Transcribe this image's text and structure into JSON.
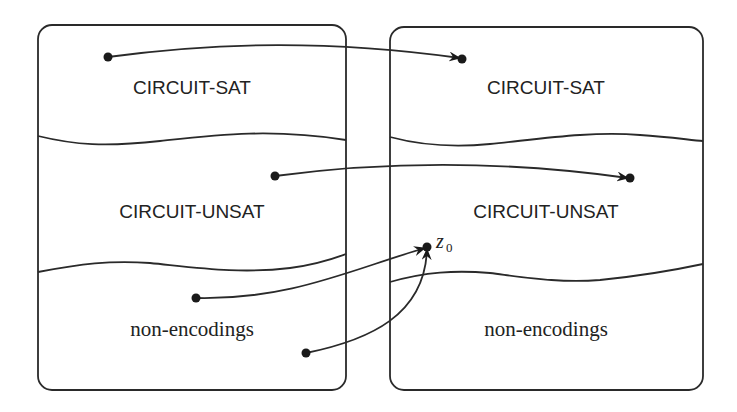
{
  "diagram": {
    "type": "reduction-mapping",
    "left_box": {
      "regions": [
        {
          "label": "CIRCUIT-SAT"
        },
        {
          "label": "CIRCUIT-UNSAT"
        },
        {
          "label": "non-encodings"
        }
      ]
    },
    "right_box": {
      "regions": [
        {
          "label": "CIRCUIT-SAT"
        },
        {
          "label": "CIRCUIT-UNSAT"
        },
        {
          "label": "non-encodings"
        }
      ]
    },
    "special_point": {
      "symbol": "z",
      "subscript": "0"
    },
    "arrows": [
      {
        "from": "left CIRCUIT-SAT",
        "to": "right CIRCUIT-SAT"
      },
      {
        "from": "left CIRCUIT-UNSAT",
        "to": "right CIRCUIT-UNSAT"
      },
      {
        "from": "left non-encodings (point 1)",
        "to": "z0"
      },
      {
        "from": "left non-encodings (point 2)",
        "to": "z0"
      }
    ],
    "colors": {
      "stroke": "#2a2a2a",
      "background": "#ffffff"
    }
  }
}
